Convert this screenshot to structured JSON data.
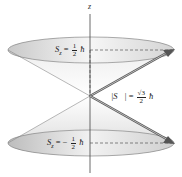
{
  "diagram": {
    "type": "spin-1/2 precession cones",
    "axis_label": "z",
    "top_label": {
      "lhs": "S",
      "sub": "z",
      "eq": "=",
      "sign": "",
      "num": "1",
      "den": "2",
      "unit": "ħ"
    },
    "bottom_label": {
      "lhs": "S",
      "sub": "z",
      "eq": "=",
      "sign": "−",
      "num": "1",
      "den": "2",
      "unit": "ħ"
    },
    "magnitude_label": {
      "lhs": "|S⃗|",
      "eq": "=",
      "num": "√3",
      "den": "2",
      "unit": "ħ"
    },
    "colors": {
      "cone_fill_light": "#f4f4f4",
      "cone_fill_dark": "#c8c8c8",
      "vector": "#555555",
      "axis": "#444444",
      "dashed": "#555555"
    }
  }
}
